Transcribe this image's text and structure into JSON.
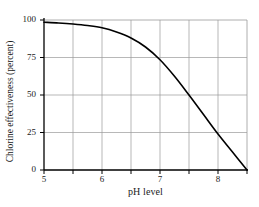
{
  "chart_data": {
    "type": "line",
    "title": "",
    "xlabel": "pH level",
    "ylabel": "Chlorine effectiveness (percent)",
    "xlim": [
      5,
      8.5
    ],
    "ylim": [
      0,
      100
    ],
    "grid": true,
    "legend": null,
    "x_tick_labels": [
      "5",
      "6",
      "7",
      "8"
    ],
    "x_tick_values": [
      5,
      6,
      7,
      8
    ],
    "x_minor_gridlines": [
      5.5,
      6,
      6.5,
      7,
      7.5,
      8
    ],
    "y_tick_labels": [
      "0",
      "25",
      "50",
      "75",
      "100"
    ],
    "y_tick_values": [
      0,
      25,
      50,
      75,
      100
    ],
    "y_gridlines": [
      25,
      50,
      75
    ],
    "series": [
      {
        "name": "Chlorine effectiveness",
        "x": [
          5.0,
          5.25,
          5.5,
          5.75,
          6.0,
          6.25,
          6.5,
          6.75,
          7.0,
          7.25,
          7.5,
          7.75,
          8.0,
          8.25,
          8.5
        ],
        "values": [
          98.5,
          98.0,
          97.3,
          96.3,
          94.8,
          92.0,
          88.0,
          82.0,
          73.5,
          62.5,
          50.0,
          37.0,
          24.0,
          12.0,
          0.0
        ]
      }
    ],
    "colors": {
      "curve": "#000000",
      "axis": "#000000",
      "grid": "#9a9a9a",
      "text": "#1a1a1a",
      "background": "#ffffff"
    }
  },
  "axes": {
    "x_title": "pH level",
    "y_title": "Chlorine effectiveness (percent)",
    "x_ticks": [
      {
        "label": "5",
        "value": 5
      },
      {
        "label": "6",
        "value": 6
      },
      {
        "label": "7",
        "value": 7
      },
      {
        "label": "8",
        "value": 8
      }
    ],
    "y_ticks": [
      {
        "label": "100",
        "value": 100
      },
      {
        "label": "75",
        "value": 75
      },
      {
        "label": "50",
        "value": 50
      },
      {
        "label": "25",
        "value": 25
      },
      {
        "label": "0",
        "value": 0
      }
    ]
  }
}
